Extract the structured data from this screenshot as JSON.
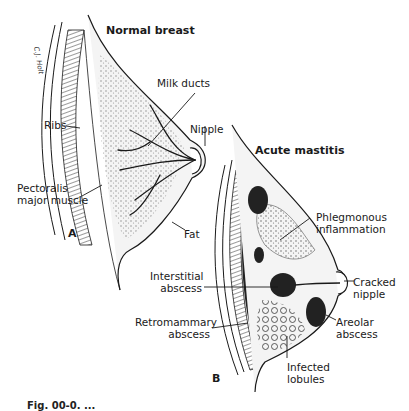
{
  "figure": {
    "panel_a": {
      "letter": "A",
      "title": "Normal breast",
      "labels": {
        "milk_ducts": "Milk ducts",
        "nipple": "Nipple",
        "ribs": "Ribs",
        "pectoralis_line1": "Pectoralis",
        "pectoralis_line2": "major muscle",
        "fat": "Fat"
      },
      "signature": "C.J. Holt"
    },
    "panel_b": {
      "letter": "B",
      "title": "Acute mastitis",
      "labels": {
        "phlegmonous_line1": "Phlegmonous",
        "phlegmonous_line2": "inflammation",
        "cracked_line1": "Cracked",
        "cracked_line2": "nipple",
        "interstitial_line1": "Interstitial",
        "interstitial_line2": "abscess",
        "retromammary_line1": "Retromammary",
        "retromammary_line2": "abscess",
        "areolar_line1": "Areolar",
        "areolar_line2": "abscess",
        "infected_line1": "Infected",
        "infected_line2": "lobules"
      }
    },
    "caption_partial": "Fig. 00-0. ..."
  },
  "colors": {
    "ink": "#1a1a1a",
    "tissue_fill": "#f4f4f4",
    "abscess_fill": "#222222",
    "shading": "#9a9a9a"
  }
}
